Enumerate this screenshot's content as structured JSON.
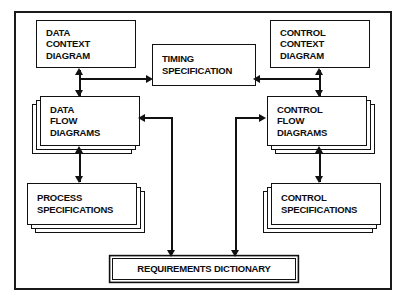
{
  "diagram": {
    "background_color": "#ffffff",
    "line_color": "#111111",
    "frame": {
      "x": 14,
      "y": 11,
      "width": 378,
      "height": 279
    },
    "nodes": [
      {
        "id": "data-context-diagram",
        "lines": [
          "DATA",
          "CONTEXT",
          "DIAGRAM"
        ],
        "stacked": false,
        "x": 36,
        "y": 20,
        "width": 100,
        "height": 48
      },
      {
        "id": "timing-specification",
        "lines": [
          "TIMING",
          "SPECIFICATION"
        ],
        "stacked": false,
        "x": 152,
        "y": 44,
        "width": 104,
        "height": 42
      },
      {
        "id": "control-context-diagram",
        "lines": [
          "CONTROL",
          "CONTEXT",
          "DIAGRAM"
        ],
        "stacked": false,
        "x": 270,
        "y": 20,
        "width": 100,
        "height": 48
      },
      {
        "id": "data-flow-diagrams",
        "lines": [
          "DATA",
          "FLOW",
          "DIAGRAMS"
        ],
        "stacked": true,
        "stack_side": "bottom-left",
        "x": 40,
        "y": 96,
        "width": 100,
        "height": 50
      },
      {
        "id": "control-flow-diagrams",
        "lines": [
          "CONTROL",
          "FLOW",
          "DIAGRAMS"
        ],
        "stacked": true,
        "stack_side": "bottom-right",
        "x": 267,
        "y": 96,
        "width": 100,
        "height": 50
      },
      {
        "id": "process-specifications",
        "lines": [
          "PROCESS",
          "SPECIFICATIONS"
        ],
        "stacked": true,
        "stack_side": "bottom-right",
        "x": 27,
        "y": 183,
        "width": 110,
        "height": 42
      },
      {
        "id": "control-specifications",
        "lines": [
          "CONTROL",
          "SPECIFICATIONS"
        ],
        "stacked": true,
        "stack_side": "bottom-left",
        "x": 271,
        "y": 183,
        "width": 110,
        "height": 42
      },
      {
        "id": "requirements-dictionary",
        "lines": [
          "REQUIREMENTS DICTIONARY"
        ],
        "stacked": false,
        "double_border": true,
        "x": 112,
        "y": 258,
        "width": 184,
        "height": 22
      }
    ],
    "connectors": [
      {
        "id": "dcd-dfd",
        "from": "data-context-diagram",
        "to": "data-flow-diagrams",
        "type": "double-headed-vertical"
      },
      {
        "id": "ccd-cfd",
        "from": "control-context-diagram",
        "to": "control-flow-diagrams",
        "type": "double-headed-vertical"
      },
      {
        "id": "dcd-timing",
        "from": "data-context-diagram",
        "to": "timing-specification",
        "type": "arrow-right"
      },
      {
        "id": "ccd-timing",
        "from": "control-context-diagram",
        "to": "timing-specification",
        "type": "arrow-left"
      },
      {
        "id": "dfd-pspec",
        "from": "data-flow-diagrams",
        "to": "process-specifications",
        "type": "double-headed-vertical"
      },
      {
        "id": "cfd-cspec",
        "from": "control-flow-diagrams",
        "to": "control-specifications",
        "type": "double-headed-vertical"
      },
      {
        "id": "dict-dfd",
        "from": "requirements-dictionary",
        "to": "data-flow-diagrams",
        "type": "elbow-arrow-left"
      },
      {
        "id": "dict-cfd",
        "from": "requirements-dictionary",
        "to": "control-flow-diagrams",
        "type": "elbow-arrow-right"
      },
      {
        "id": "left-to-dict",
        "from": "data-flow-diagrams",
        "to": "requirements-dictionary",
        "type": "arrow-down"
      },
      {
        "id": "right-to-dict",
        "from": "control-flow-diagrams",
        "to": "requirements-dictionary",
        "type": "arrow-down"
      }
    ]
  }
}
